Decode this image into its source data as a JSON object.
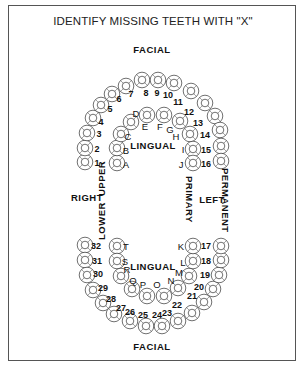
{
  "title": "IDENTIFY MISSING TEETH WITH \"X\"",
  "labels": {
    "facial_top": "FACIAL",
    "facial_bottom": "FACIAL",
    "lingual_upper": "LINGUAL",
    "lingual_lower": "LINGUAL",
    "right": "RIGHT",
    "left": "LEFT",
    "upper": "UPPER",
    "lower": "LOWER",
    "primary": "PRIMARY",
    "permanent": "PERMANENT"
  },
  "teeth": {
    "permanent_upper": [
      {
        "id": "1",
        "x": 85,
        "y": 162,
        "lx": 97,
        "ly": 166
      },
      {
        "id": "2",
        "x": 85,
        "y": 148,
        "lx": 97,
        "ly": 152
      },
      {
        "id": "3",
        "x": 87,
        "y": 133,
        "lx": 99,
        "ly": 137
      },
      {
        "id": "4",
        "x": 93,
        "y": 118,
        "lx": 101,
        "ly": 125
      },
      {
        "id": "5",
        "x": 101,
        "y": 105,
        "lx": 110,
        "ly": 112
      },
      {
        "id": "6",
        "x": 112,
        "y": 94,
        "lx": 119,
        "ly": 102
      },
      {
        "id": "7",
        "x": 126,
        "y": 86,
        "lx": 131,
        "ly": 97
      },
      {
        "id": "8",
        "x": 142,
        "y": 80,
        "lx": 146,
        "ly": 96
      },
      {
        "id": "9",
        "x": 158,
        "y": 80,
        "lx": 157,
        "ly": 96
      },
      {
        "id": "10",
        "x": 174,
        "y": 83,
        "lx": 168,
        "ly": 98
      },
      {
        "id": "11",
        "x": 191,
        "y": 91,
        "lx": 178,
        "ly": 105
      },
      {
        "id": "12",
        "x": 205,
        "y": 103,
        "lx": 189,
        "ly": 115
      },
      {
        "id": "13",
        "x": 215,
        "y": 116,
        "lx": 198,
        "ly": 126
      },
      {
        "id": "14",
        "x": 220,
        "y": 130,
        "lx": 205,
        "ly": 138
      },
      {
        "id": "15",
        "x": 221,
        "y": 146,
        "lx": 206,
        "ly": 153
      },
      {
        "id": "16",
        "x": 221,
        "y": 161,
        "lx": 206,
        "ly": 167
      }
    ],
    "primary_upper": [
      {
        "id": "A",
        "x": 117,
        "y": 163,
        "lx": 126,
        "ly": 168
      },
      {
        "id": "B",
        "x": 117,
        "y": 148,
        "lx": 126,
        "ly": 154
      },
      {
        "id": "C",
        "x": 121,
        "y": 134,
        "lx": 128,
        "ly": 140
      },
      {
        "id": "D",
        "x": 131,
        "y": 122,
        "lx": 136,
        "ly": 117
      },
      {
        "id": "E",
        "x": 147,
        "y": 115,
        "lx": 145,
        "ly": 130
      },
      {
        "id": "F",
        "x": 164,
        "y": 115,
        "lx": 160,
        "ly": 130
      },
      {
        "id": "G",
        "x": 180,
        "y": 121,
        "lx": 170,
        "ly": 133
      },
      {
        "id": "H",
        "x": 190,
        "y": 134,
        "lx": 176,
        "ly": 140
      },
      {
        "id": "I",
        "x": 193,
        "y": 149,
        "lx": 183,
        "ly": 153
      },
      {
        "id": "J",
        "x": 193,
        "y": 163,
        "lx": 181,
        "ly": 168
      }
    ],
    "permanent_lower": [
      {
        "id": "32",
        "x": 85,
        "y": 245,
        "lx": 96,
        "ly": 249
      },
      {
        "id": "31",
        "x": 85,
        "y": 260,
        "lx": 97,
        "ly": 264
      },
      {
        "id": "30",
        "x": 87,
        "y": 275,
        "lx": 98,
        "ly": 277
      },
      {
        "id": "29",
        "x": 93,
        "y": 290,
        "lx": 103,
        "ly": 291
      },
      {
        "id": "28",
        "x": 103,
        "y": 303,
        "lx": 111,
        "ly": 302
      },
      {
        "id": "27",
        "x": 114,
        "y": 314,
        "lx": 121,
        "ly": 311
      },
      {
        "id": "26",
        "x": 130,
        "y": 321,
        "lx": 130,
        "ly": 315
      },
      {
        "id": "25",
        "x": 146,
        "y": 326,
        "lx": 143,
        "ly": 318
      },
      {
        "id": "24",
        "x": 162,
        "y": 326,
        "lx": 157,
        "ly": 318
      },
      {
        "id": "23",
        "x": 178,
        "y": 321,
        "lx": 167,
        "ly": 316
      },
      {
        "id": "22",
        "x": 192,
        "y": 313,
        "lx": 177,
        "ly": 308
      },
      {
        "id": "21",
        "x": 204,
        "y": 302,
        "lx": 192,
        "ly": 299
      },
      {
        "id": "20",
        "x": 213,
        "y": 289,
        "lx": 199,
        "ly": 290
      },
      {
        "id": "19",
        "x": 219,
        "y": 275,
        "lx": 205,
        "ly": 278
      },
      {
        "id": "18",
        "x": 221,
        "y": 260,
        "lx": 206,
        "ly": 264
      },
      {
        "id": "17",
        "x": 221,
        "y": 246,
        "lx": 206,
        "ly": 249
      }
    ],
    "primary_lower": [
      {
        "id": "T",
        "x": 117,
        "y": 246,
        "lx": 126,
        "ly": 250
      },
      {
        "id": "S",
        "x": 117,
        "y": 261,
        "lx": 125,
        "ly": 265
      },
      {
        "id": "R",
        "x": 121,
        "y": 276,
        "lx": 127,
        "ly": 273
      },
      {
        "id": "Q",
        "x": 132,
        "y": 289,
        "lx": 133,
        "ly": 284
      },
      {
        "id": "P",
        "x": 147,
        "y": 296,
        "lx": 143,
        "ly": 288
      },
      {
        "id": "O",
        "x": 164,
        "y": 296,
        "lx": 157,
        "ly": 288
      },
      {
        "id": "N",
        "x": 178,
        "y": 288,
        "lx": 171,
        "ly": 284
      },
      {
        "id": "M",
        "x": 189,
        "y": 276,
        "lx": 179,
        "ly": 276
      },
      {
        "id": "L",
        "x": 193,
        "y": 261,
        "lx": 183,
        "ly": 266
      },
      {
        "id": "K",
        "x": 193,
        "y": 246,
        "lx": 181,
        "ly": 250
      }
    ]
  }
}
